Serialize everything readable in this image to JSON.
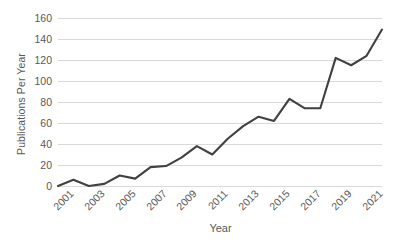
{
  "chart_data": {
    "type": "line",
    "title": "",
    "xlabel": "Year",
    "ylabel": "Publications Per Year",
    "x": [
      2001,
      2002,
      2003,
      2004,
      2005,
      2006,
      2007,
      2008,
      2009,
      2010,
      2011,
      2012,
      2013,
      2014,
      2015,
      2016,
      2017,
      2018,
      2019,
      2020,
      2021,
      2022
    ],
    "values": [
      0,
      6,
      0,
      2,
      10,
      7,
      18,
      19,
      27,
      38,
      30,
      45,
      57,
      66,
      62,
      83,
      74,
      74,
      122,
      115,
      124,
      149
    ],
    "series": [
      {
        "name": "Publications Per Year",
        "values": [
          0,
          6,
          0,
          2,
          10,
          7,
          18,
          19,
          27,
          38,
          30,
          45,
          57,
          66,
          62,
          83,
          74,
          74,
          122,
          115,
          124,
          149
        ]
      }
    ],
    "ylim": [
      0,
      160
    ],
    "xlim": [
      2001,
      2022
    ],
    "y_ticks": [
      0,
      20,
      40,
      60,
      80,
      100,
      120,
      140,
      160
    ],
    "y_tick_labels": [
      "0",
      "20",
      "40",
      "60",
      "80",
      "100",
      "120",
      "140",
      "160"
    ],
    "x_tick_values": [
      2001,
      2003,
      2005,
      2007,
      2009,
      2011,
      2013,
      2015,
      2017,
      2019,
      2021
    ],
    "x_tick_labels": [
      "2001",
      "2003",
      "2005",
      "2007",
      "2009",
      "2011",
      "2013",
      "2015",
      "2017",
      "2019",
      "2021"
    ],
    "x_tick_rotation": -45,
    "grid": "horizontal",
    "legend": "none",
    "colors": {
      "line": "#404040",
      "gridline": "#d9d9d9",
      "text": "#595959",
      "background": "#ffffff"
    }
  }
}
